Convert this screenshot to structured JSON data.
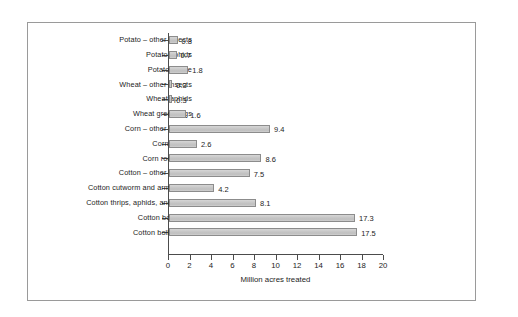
{
  "chart_data": {
    "type": "bar",
    "orientation": "horizontal",
    "title": "",
    "xlabel": "Million acres treated",
    "ylabel": "",
    "xlim": [
      0,
      20
    ],
    "xticks": [
      0,
      2,
      4,
      6,
      8,
      10,
      12,
      14,
      16,
      18,
      20
    ],
    "grid": false,
    "legend": null,
    "categories": [
      "Potato – other insects",
      "Potato aphids",
      "Potato beetle",
      "Wheat – other insects",
      "Wheat aphids",
      "Wheat greenbugs",
      "Corn – other insects",
      "Corn borers",
      "Corn rootworm",
      "Cotton – other insects",
      "Cotton cutworm and armyworm",
      "Cotton thrips, aphids, and mites",
      "Cotton bollworm",
      "Cotton boll weevil"
    ],
    "values": [
      0.8,
      0.7,
      1.8,
      0.3,
      0.3,
      1.6,
      9.4,
      2.6,
      8.6,
      7.5,
      4.2,
      8.1,
      17.3,
      17.5
    ],
    "value_labels": [
      "0.8",
      "0.7",
      "1.8",
      "0.3",
      "0.3",
      "1.6",
      "9.4",
      "2.6",
      "8.6",
      "7.5",
      "4.2",
      "8.1",
      "17.3",
      "17.5"
    ],
    "bar_fill": "#c9c9c9",
    "bar_edge": "#8c8c8c",
    "axis_color": "#4c4c4c",
    "frame_color": "#9a9a9a"
  }
}
